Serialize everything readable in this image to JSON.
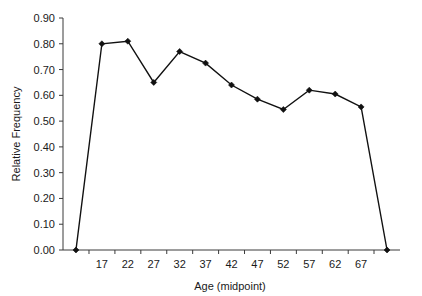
{
  "chart_data": {
    "type": "line",
    "title": "",
    "xlabel": "Age (midpoint)",
    "ylabel": "Relative Frequency",
    "grid": false,
    "legend": "none",
    "xlim": [
      9.5,
      74.5
    ],
    "ylim": [
      0.0,
      0.9
    ],
    "x": [
      12,
      17,
      22,
      27,
      32,
      37,
      42,
      47,
      52,
      57,
      62,
      67,
      72
    ],
    "values": [
      0.0,
      0.8,
      0.81,
      0.65,
      0.77,
      0.725,
      0.64,
      0.585,
      0.545,
      0.62,
      0.605,
      0.555,
      0.0
    ],
    "x_tick_labels": [
      "17",
      "22",
      "27",
      "32",
      "37",
      "42",
      "47",
      "52",
      "57",
      "62",
      "67"
    ],
    "x_tick_values": [
      17,
      22,
      27,
      32,
      37,
      42,
      47,
      52,
      57,
      62,
      67
    ],
    "y_tick_labels": [
      "0.00",
      "0.10",
      "0.20",
      "0.30",
      "0.40",
      "0.50",
      "0.60",
      "0.70",
      "0.80",
      "0.90"
    ],
    "y_tick_values": [
      0.0,
      0.1,
      0.2,
      0.3,
      0.4,
      0.5,
      0.6,
      0.7,
      0.8,
      0.9
    ],
    "marker": "diamond",
    "line_color": "#111111",
    "marker_color": "#111111",
    "axis_color": "#3a3a3a",
    "background": "#ffffff"
  }
}
